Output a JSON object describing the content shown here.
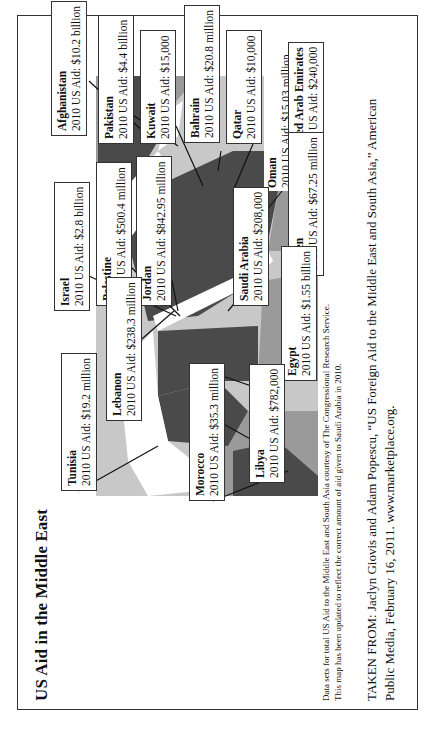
{
  "title": "US Aid in the Middle East",
  "labels": [
    {
      "country": "Afghanistan",
      "aid": "2010 US Aid: $10.2 billion"
    },
    {
      "country": "Pakistan",
      "aid": "2010 US Aid: $4.4 billion"
    },
    {
      "country": "Kuwait",
      "aid": "2010 US Aid: $15,000"
    },
    {
      "country": "Bahrain",
      "aid": "2010 US Aid: $20.8 million"
    },
    {
      "country": "Qatar",
      "aid": "2010 US Aid: $10,000"
    },
    {
      "country": "Oman",
      "aid": "2010 US Aid: $15.03 million"
    },
    {
      "country": "United Arab Emirates",
      "aid": "2010 US Aid: $240,000"
    },
    {
      "country": "Yemen",
      "aid": "2010 US Aid: $67.25 million"
    },
    {
      "country": "Palestine",
      "aid": "2010 US Aid: $500.4 million"
    },
    {
      "country": "Jordan",
      "aid": "2010 US Aid: $842.95 million"
    },
    {
      "country": "Israel",
      "aid": "2010 US Aid: $2.8 billion"
    },
    {
      "country": "Saudi Arabia",
      "aid": "2010 US Aid: $208,000"
    },
    {
      "country": "Egypt",
      "aid": "2010 US Aid: $1.55 billion"
    },
    {
      "country": "Lebanon",
      "aid": "2010 US Aid: $238.3 million"
    },
    {
      "country": "Tunisia",
      "aid": "2010 US Aid: $19.2 million"
    },
    {
      "country": "Morocco",
      "aid": "2010 US Aid: $35.3 million"
    },
    {
      "country": "Libya",
      "aid": "2010 US Aid: $782,000"
    }
  ],
  "footnote": {
    "line1": "Data sets for total US Aid to the Middle East and South Asia courtesy of The Congressional Research Service.",
    "line2": "This map has been updated to reflect the correct amount of aid given to Saudi Arabia in 2010."
  },
  "source": {
    "line1": "TAKEN FROM: Jaclyn Giovis and Adam Popescu, “US Foreign Aid to the Middle East and South Asia,” American",
    "line2": "Public Media, February 16, 2011. www.marketplace.org."
  },
  "colors": {
    "dark_country": "#4a4a4a",
    "mid_country": "#9a9a9a",
    "light_land": "#c8c8c8",
    "sea": "#ffffff",
    "border": "#333333"
  }
}
